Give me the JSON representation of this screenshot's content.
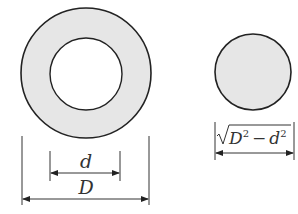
{
  "diagram": {
    "left_figure": {
      "description": "annulus (hollow circle)",
      "outer_diameter_label": "D",
      "inner_diameter_label": "d"
    },
    "right_figure": {
      "description": "solid circle of equivalent area",
      "diameter_label_radicand": "D² − d²",
      "label_D": "D",
      "label_d": "d",
      "exp_D": "2",
      "exp_d": "2",
      "minus": "−"
    },
    "colors": {
      "fill": "#e6e6e6",
      "stroke": "#222222"
    }
  }
}
